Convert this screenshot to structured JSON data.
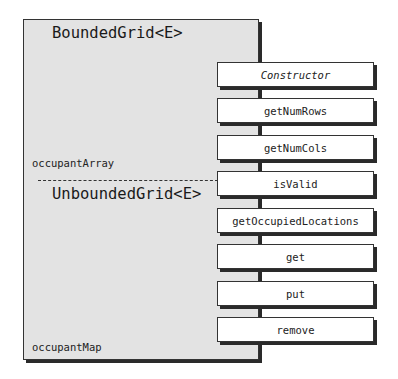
{
  "diagram": {
    "classes": [
      {
        "name": "BoundedGrid<E>",
        "field": "occupantArray"
      },
      {
        "name": "UnboundedGrid<E>",
        "field": "occupantMap"
      }
    ],
    "methods": [
      {
        "label": "Constructor",
        "italic": true
      },
      {
        "label": "getNumRows"
      },
      {
        "label": "getNumCols"
      },
      {
        "label": "isValid"
      },
      {
        "label": "getOccupiedLocations"
      },
      {
        "label": "get"
      },
      {
        "label": "put"
      },
      {
        "label": "remove"
      }
    ],
    "colors": {
      "class_fill": "#e3e3e3",
      "method_fill": "#ffffff",
      "border": "#333333",
      "shadow": "#2a2a2a"
    }
  }
}
